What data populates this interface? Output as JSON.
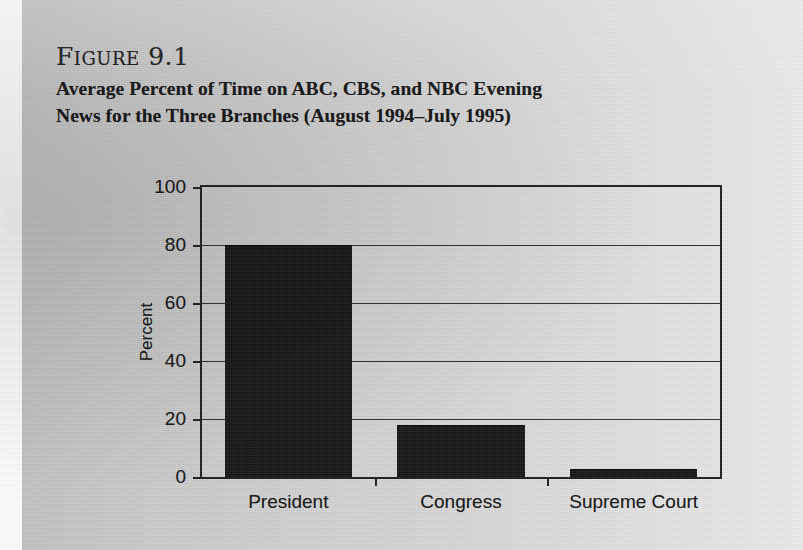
{
  "page": {
    "figure_label": "Figure 9.1",
    "title_line_1": "Average Percent of Time on ABC, CBS, and NBC Evening",
    "title_line_2": "News for the Three Branches (August 1994–July 1995)"
  },
  "chart_data": {
    "type": "bar",
    "title": "Average Percent of Time on ABC, CBS, and NBC Evening News for the Three Branches (August 1994–July 1995)",
    "categories": [
      "President",
      "Congress",
      "Supreme Court"
    ],
    "values": [
      79.5,
      17.5,
      2.5
    ],
    "xlabel": "",
    "ylabel": "Percent",
    "ylim": [
      0,
      100
    ],
    "yticks": [
      0,
      20,
      40,
      60,
      80,
      100
    ],
    "ytick_labels": [
      "0",
      "20",
      "40",
      "60",
      "80",
      "100"
    ],
    "grid": true,
    "grid_axis": "y",
    "legend": false,
    "bar_color": "#161616",
    "axis_color": "#1d1d1d",
    "background_color": "#d4d4d4"
  }
}
